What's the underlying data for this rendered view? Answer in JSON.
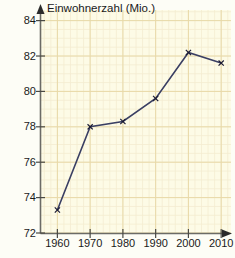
{
  "chart_data": {
    "type": "line",
    "title": "Einwohnerzahl (Mio.)",
    "xlabel": "",
    "ylabel": "Einwohnerzahl (Mio.)",
    "x": [
      1960,
      1970,
      1980,
      1990,
      2000,
      2010
    ],
    "values": [
      73.3,
      78.0,
      78.3,
      79.6,
      82.2,
      81.6
    ],
    "series": [
      {
        "name": "Einwohnerzahl",
        "values": [
          73.3,
          78.0,
          78.3,
          79.6,
          82.2,
          81.6
        ]
      }
    ],
    "categories": [
      "1960",
      "1970",
      "1980",
      "1990",
      "2000",
      "2010"
    ],
    "xlim": [
      1955,
      2013
    ],
    "ylim": [
      72,
      84.6
    ],
    "xticks": [
      1960,
      1970,
      1980,
      1990,
      2000,
      2010
    ],
    "xtick_labels": [
      "1960",
      "1970",
      "1980",
      "1990",
      "2000",
      "2010"
    ],
    "yticks": [
      72,
      74,
      76,
      78,
      80,
      82,
      84
    ],
    "ytick_labels": [
      "72",
      "74",
      "76",
      "78",
      "80",
      "82",
      "84"
    ],
    "grid": true,
    "grid_minor": true,
    "legend": false,
    "legend_position": "none",
    "marker": "x",
    "line_color": "#3a3f63",
    "marker_color": "#1a1a33",
    "grid_major_color": "#e8d9a8",
    "grid_minor_color": "#f4ecd0",
    "plot_background": "#fdfbe6",
    "axis_color": "#6b6b66",
    "text_color": "#1a1a1a",
    "x_axis_arrow": true,
    "y_axis_arrow": true
  },
  "axes": {
    "y_ticks": [
      {
        "label": "84",
        "value": 84
      },
      {
        "label": "82",
        "value": 82
      },
      {
        "label": "80",
        "value": 80
      },
      {
        "label": "78",
        "value": 78
      },
      {
        "label": "76",
        "value": 76
      },
      {
        "label": "74",
        "value": 74
      },
      {
        "label": "72",
        "value": 72
      }
    ],
    "x_ticks": [
      {
        "label": "1960",
        "value": 1960
      },
      {
        "label": "1970",
        "value": 1970
      },
      {
        "label": "1980",
        "value": 1980
      },
      {
        "label": "1990",
        "value": 1990
      },
      {
        "label": "2000",
        "value": 2000
      },
      {
        "label": "2010",
        "value": 2010
      }
    ]
  }
}
